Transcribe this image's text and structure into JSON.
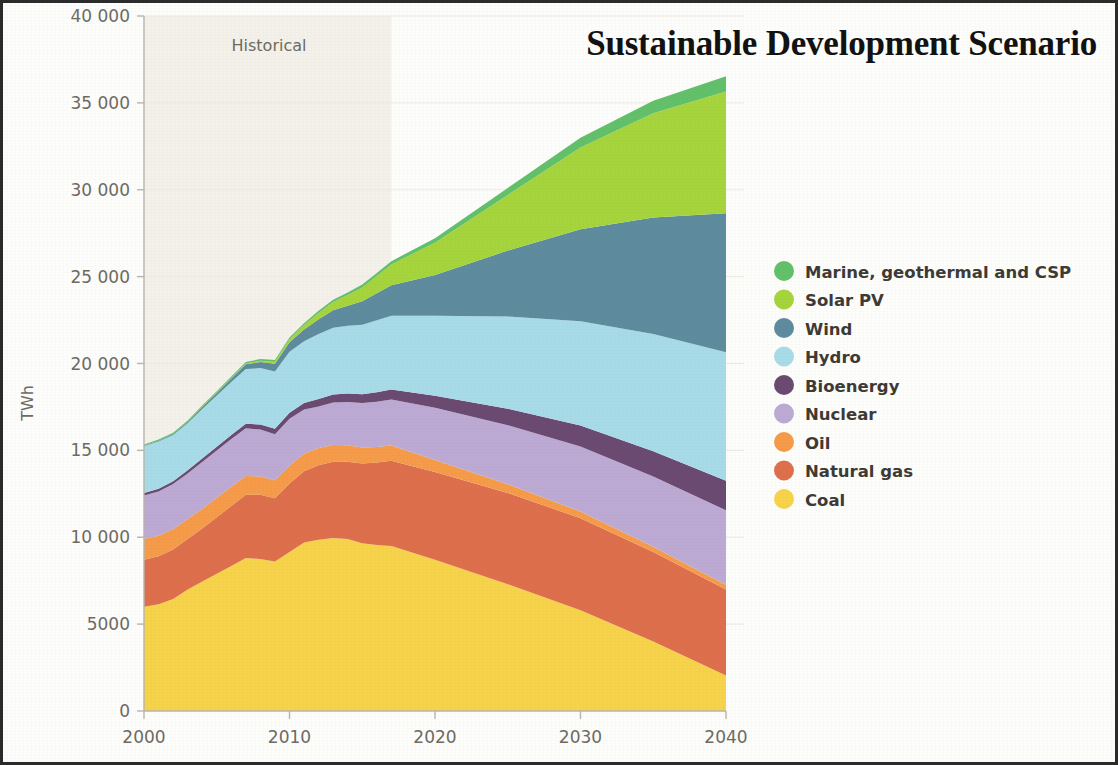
{
  "figure": {
    "title": "Sustainable Development Scenario",
    "historical_label": "Historical",
    "frame_color": "#2b2b2b",
    "background_color": "#fdfdfb",
    "historical_shade_color": "#f3f1ea"
  },
  "axes": {
    "y_axis_title": "TWh",
    "y_ticks": [
      "0",
      "5000",
      "10 000",
      "15 000",
      "20 000",
      "25 000",
      "30 000",
      "35 000",
      "40 000"
    ],
    "y_tick_values": [
      0,
      5000,
      10000,
      15000,
      20000,
      25000,
      30000,
      35000,
      40000
    ],
    "x_ticks": [
      "2000",
      "2010",
      "2020",
      "2030",
      "2040"
    ],
    "x_tick_values": [
      2000,
      2010,
      2020,
      2030,
      2040
    ]
  },
  "legend": {
    "items": [
      {
        "label": "Marine, geothermal and CSP",
        "color": "#63c06a"
      },
      {
        "label": "Solar PV",
        "color": "#a5d43c"
      },
      {
        "label": "Wind",
        "color": "#5e8c9e"
      },
      {
        "label": "Hydro",
        "color": "#a8dbe8"
      },
      {
        "label": "Bioenergy",
        "color": "#6b4a72"
      },
      {
        "label": "Nuclear",
        "color": "#bcaad4"
      },
      {
        "label": "Oil",
        "color": "#f59b4a"
      },
      {
        "label": "Natural gas",
        "color": "#dd6f4d"
      },
      {
        "label": "Coal",
        "color": "#f6d34a"
      }
    ]
  },
  "chart_data": {
    "type": "area",
    "title": "Sustainable Development Scenario",
    "xlabel": "",
    "ylabel": "TWh",
    "xlim": [
      2000,
      2040
    ],
    "ylim": [
      0,
      40000
    ],
    "grid": true,
    "legend_position": "right",
    "stacked": true,
    "stack_order_bottom_to_top": [
      "Coal",
      "Natural gas",
      "Oil",
      "Nuclear",
      "Bioenergy",
      "Hydro",
      "Wind",
      "Solar PV",
      "Marine, geothermal and CSP"
    ],
    "historical_range": [
      2000,
      2017
    ],
    "projection_range": [
      2017,
      2040
    ],
    "x": [
      2000,
      2001,
      2002,
      2003,
      2004,
      2005,
      2006,
      2007,
      2008,
      2009,
      2010,
      2011,
      2012,
      2013,
      2014,
      2015,
      2016,
      2017,
      2020,
      2025,
      2030,
      2035,
      2040
    ],
    "series": [
      {
        "name": "Coal",
        "color": "#f6d34a",
        "values": [
          6000,
          6150,
          6450,
          7000,
          7450,
          7900,
          8350,
          8800,
          8750,
          8600,
          9150,
          9700,
          9850,
          9950,
          9900,
          9650,
          9550,
          9500,
          8700,
          7300,
          5800,
          4000,
          2050
        ]
      },
      {
        "name": "Natural gas",
        "color": "#dd6f4d",
        "values": [
          2700,
          2750,
          2850,
          2900,
          3050,
          3250,
          3450,
          3650,
          3700,
          3650,
          3950,
          4100,
          4300,
          4400,
          4450,
          4600,
          4750,
          4900,
          5050,
          5250,
          5300,
          5150,
          4950
        ]
      },
      {
        "name": "Oil",
        "color": "#f59b4a",
        "values": [
          1200,
          1180,
          1160,
          1150,
          1130,
          1120,
          1100,
          1080,
          1050,
          1030,
          1020,
          1000,
          980,
          960,
          940,
          920,
          900,
          880,
          700,
          500,
          380,
          300,
          250
        ]
      },
      {
        "name": "Nuclear",
        "color": "#bcaad4",
        "values": [
          2500,
          2550,
          2600,
          2620,
          2700,
          2720,
          2750,
          2740,
          2700,
          2650,
          2700,
          2550,
          2400,
          2450,
          2500,
          2550,
          2600,
          2650,
          3000,
          3400,
          3750,
          4050,
          4300
        ]
      },
      {
        "name": "Bioenergy",
        "color": "#6b4a72",
        "values": [
          150,
          160,
          170,
          185,
          200,
          215,
          235,
          260,
          285,
          310,
          350,
          380,
          420,
          450,
          480,
          510,
          540,
          570,
          700,
          950,
          1200,
          1450,
          1700
        ]
      },
      {
        "name": "Hydro",
        "color": "#a8dbe8",
        "values": [
          2700,
          2720,
          2650,
          2700,
          2850,
          2950,
          3050,
          3150,
          3250,
          3300,
          3500,
          3550,
          3750,
          3850,
          3900,
          4000,
          4150,
          4250,
          4600,
          5300,
          6000,
          6750,
          7400
        ]
      },
      {
        "name": "Wind",
        "color": "#5e8c9e",
        "values": [
          30,
          45,
          60,
          80,
          110,
          150,
          200,
          270,
          350,
          440,
          550,
          680,
          850,
          1000,
          1150,
          1350,
          1550,
          1750,
          2350,
          3800,
          5300,
          6700,
          8000
        ]
      },
      {
        "name": "Solar PV",
        "color": "#a5d43c",
        "values": [
          5,
          6,
          8,
          12,
          18,
          25,
          35,
          50,
          80,
          120,
          170,
          250,
          360,
          480,
          620,
          800,
          1000,
          1200,
          1850,
          3200,
          4700,
          6000,
          7000
        ]
      },
      {
        "name": "Marine, geothermal and CSP",
        "color": "#63c06a",
        "values": [
          60,
          62,
          65,
          68,
          72,
          76,
          80,
          85,
          90,
          95,
          100,
          110,
          120,
          130,
          145,
          160,
          175,
          190,
          260,
          400,
          560,
          720,
          880
        ]
      }
    ]
  }
}
